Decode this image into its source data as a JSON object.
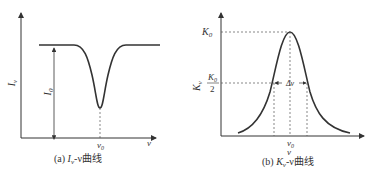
{
  "panel_a": {
    "y_label": "I",
    "y_label_sub": "ν",
    "amplitude_label": "I",
    "amplitude_sub": "0",
    "x_tick": "ν",
    "x_tick_sub": "0",
    "x_label": "ν",
    "caption_prefix": "(a) ",
    "caption_var": "I",
    "caption_var_sub": "ν",
    "caption_suffix": "-ν曲线"
  },
  "panel_b": {
    "y_label": "K",
    "y_label_sub": "ν",
    "peak_label": "K",
    "peak_sub": "0",
    "half_num": "K",
    "half_num_sub": "0",
    "half_den": "2",
    "width_label": "Δν",
    "x_tick": "ν",
    "x_tick_sub": "0",
    "x_label": "ν",
    "caption_prefix": "(b) ",
    "caption_var": "K",
    "caption_var_sub": "ν",
    "caption_suffix": "-ν曲线"
  },
  "colors": {
    "line": "#333333",
    "dash": "#555555"
  }
}
